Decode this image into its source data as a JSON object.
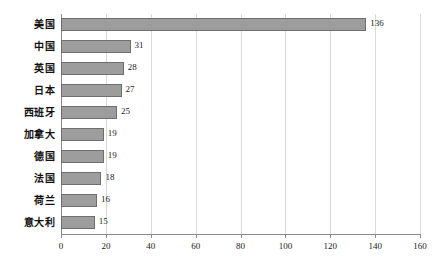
{
  "chart_data": {
    "type": "bar",
    "orientation": "horizontal",
    "title": "",
    "subtitle": "",
    "xlabel": "",
    "ylabel": "",
    "categories": [
      "美国",
      "中国",
      "英国",
      "日本",
      "西班牙",
      "加拿大",
      "德国",
      "法国",
      "荷兰",
      "意大利"
    ],
    "values": [
      136,
      31,
      28,
      27,
      25,
      19,
      19,
      18,
      16,
      15
    ],
    "data_labels": [
      "136",
      "31",
      "28",
      "27",
      "25",
      "19",
      "19",
      "18",
      "16",
      "15"
    ],
    "xlim": [
      0,
      160
    ],
    "xticks": [
      0,
      20,
      40,
      60,
      80,
      100,
      120,
      140,
      160
    ],
    "xtick_labels": [
      "0",
      "20",
      "40",
      "60",
      "80",
      "100",
      "120",
      "140",
      "160"
    ],
    "grid": "vertical",
    "legend": "none",
    "colors": {
      "bar_fill": "#9d9d9d",
      "bar_border": "#6e6e6e",
      "gridline": "#d9d9d9",
      "axis_line": "#8a8a8a",
      "text": "#1a1a1a",
      "background": "#ffffff"
    }
  }
}
